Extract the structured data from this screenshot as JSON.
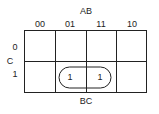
{
  "kmap": {
    "top_variable": "AB",
    "side_variable": "C",
    "bottom_label": "BC",
    "column_headers": [
      "00",
      "01",
      "11",
      "10"
    ],
    "row_headers": [
      "0",
      "1"
    ],
    "cells": [
      [
        "",
        "",
        "",
        ""
      ],
      [
        "",
        "1",
        "1",
        ""
      ]
    ],
    "groups": [
      {
        "row": 1,
        "columns": [
          1,
          2
        ]
      }
    ]
  }
}
